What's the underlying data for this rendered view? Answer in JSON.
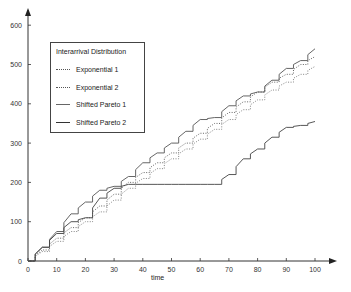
{
  "chart_data": {
    "type": "line",
    "title": "",
    "xlabel": "time",
    "ylabel": "",
    "xlim": [
      0,
      100
    ],
    "ylim": [
      0,
      620
    ],
    "x_ticks": [
      0,
      10,
      20,
      30,
      40,
      50,
      60,
      70,
      80,
      90,
      100
    ],
    "y_ticks": [
      0,
      100,
      200,
      300,
      400,
      500,
      600
    ],
    "grid": false,
    "legend": {
      "title": "Interarrival Distribution",
      "position": "upper-left",
      "entries": [
        "Exponential  1",
        "Exponential  2",
        "Shifted Pareto  1",
        "Shifted Pareto  2"
      ]
    },
    "x": [
      0,
      5,
      10,
      15,
      20,
      25,
      30,
      35,
      40,
      45,
      50,
      55,
      60,
      65,
      70,
      75,
      80,
      85,
      90,
      95,
      100
    ],
    "series": [
      {
        "name": "Exponential 1",
        "style": "dotted",
        "values": [
          0,
          28,
          58,
          85,
          110,
          140,
          170,
          200,
          225,
          250,
          275,
          300,
          325,
          350,
          378,
          405,
          430,
          455,
          475,
          500,
          520
        ]
      },
      {
        "name": "Exponential 2",
        "style": "dotted",
        "values": [
          0,
          24,
          50,
          75,
          100,
          125,
          155,
          185,
          210,
          235,
          260,
          285,
          310,
          335,
          360,
          385,
          410,
          435,
          455,
          475,
          495
        ]
      },
      {
        "name": "Shifted Pareto 1",
        "style": "solid",
        "values": [
          0,
          35,
          75,
          120,
          150,
          180,
          190,
          215,
          250,
          275,
          300,
          330,
          360,
          365,
          395,
          420,
          430,
          460,
          490,
          510,
          540
        ]
      },
      {
        "name": "Shifted Pareto 2",
        "style": "solid",
        "values": [
          0,
          35,
          70,
          100,
          110,
          160,
          185,
          195,
          195,
          195,
          195,
          195,
          195,
          195,
          220,
          260,
          285,
          315,
          340,
          345,
          355
        ]
      }
    ]
  },
  "legend": {
    "title": "Interarrival Distribution",
    "items": [
      "Exponential  1",
      "Exponential  2",
      "Shifted Pareto  1",
      "Shifted Pareto  2"
    ]
  },
  "axes": {
    "xlabel": "time"
  }
}
